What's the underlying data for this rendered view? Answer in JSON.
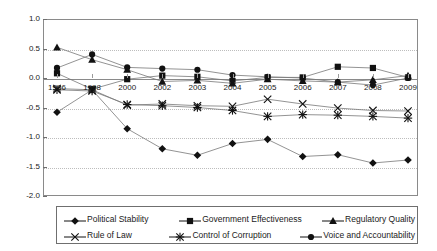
{
  "chart_data": {
    "type": "line",
    "title": "",
    "xlabel": "",
    "ylabel": "",
    "x": [
      1996,
      1998,
      2000,
      2002,
      2003,
      2004,
      2005,
      2006,
      2007,
      2008,
      2009
    ],
    "xtick_labels": [
      "1996",
      "1998",
      "2000",
      "2002",
      "2003",
      "2004",
      "2005",
      "2006",
      "2007",
      "2008",
      "2009"
    ],
    "ylim": [
      -2.0,
      1.0
    ],
    "ytick_labels": [
      "1.0",
      "0.5",
      "0.0",
      "-0.5",
      "-1.0",
      "-1.5",
      "-2.0"
    ],
    "ytick_values": [
      1.0,
      0.5,
      0.0,
      -0.5,
      -1.0,
      -1.5,
      -2.0
    ],
    "grid": "horizontal-dotted",
    "legend_position": "bottom",
    "series": [
      {
        "name": "Political Stability",
        "marker": "diamond",
        "values": [
          -0.58,
          -0.2,
          -0.86,
          -1.2,
          -1.31,
          -1.11,
          -1.04,
          -1.33,
          -1.3,
          -1.44,
          -1.39
        ]
      },
      {
        "name": "Government Effectiveness",
        "marker": "square",
        "values": [
          0.08,
          -0.19,
          -0.02,
          0.04,
          0.02,
          -0.05,
          0.01,
          0.01,
          0.19,
          0.17,
          0.01
        ]
      },
      {
        "name": "Regulatory Quality",
        "marker": "triangle",
        "values": [
          0.52,
          0.31,
          0.14,
          -0.06,
          -0.04,
          -0.09,
          -0.02,
          -0.05,
          -0.07,
          -0.03,
          0.04
        ]
      },
      {
        "name": "Rule of Law",
        "marker": "x",
        "values": [
          -0.18,
          -0.2,
          -0.46,
          -0.44,
          -0.47,
          -0.48,
          -0.36,
          -0.44,
          -0.51,
          -0.55,
          -0.56
        ]
      },
      {
        "name": "Control of Corruption",
        "marker": "asterisk",
        "values": [
          -0.2,
          -0.22,
          -0.45,
          -0.47,
          -0.5,
          -0.55,
          -0.65,
          -0.62,
          -0.63,
          -0.65,
          -0.68
        ]
      },
      {
        "name": "Voice and Accountability",
        "marker": "circle",
        "values": [
          0.17,
          0.4,
          0.18,
          0.16,
          0.14,
          0.05,
          0.02,
          0.0,
          -0.07,
          -0.12,
          0.0
        ]
      }
    ]
  },
  "legend": {
    "items": [
      {
        "label": "Political Stability",
        "marker": "diamond"
      },
      {
        "label": "Government Effectiveness",
        "marker": "square"
      },
      {
        "label": "Regulatory Quality",
        "marker": "triangle"
      },
      {
        "label": "Rule of Law",
        "marker": "x"
      },
      {
        "label": "Control of Corruption",
        "marker": "asterisk"
      },
      {
        "label": "Voice and Accountability",
        "marker": "circle"
      }
    ]
  },
  "colors": {
    "line": "#777777",
    "marker": "#111111",
    "grid": "#bdbdbd",
    "axis": "#8a8a8a",
    "text": "#1a1a1a",
    "background": "#ffffff"
  }
}
